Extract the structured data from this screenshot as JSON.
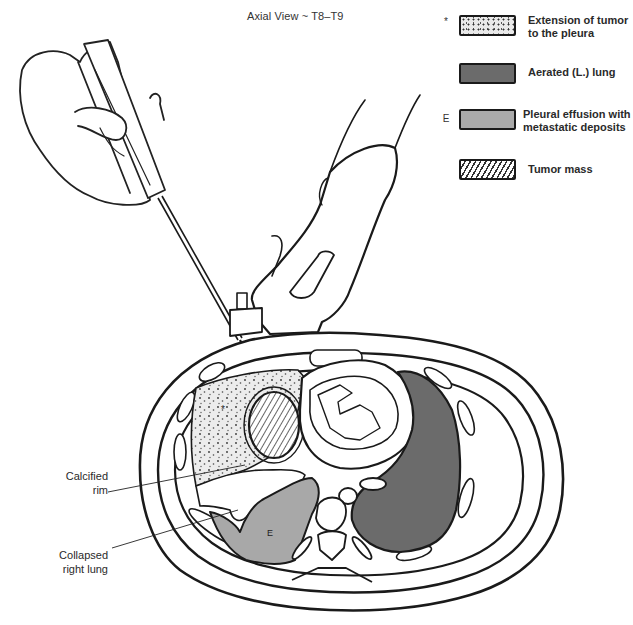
{
  "title": "Axial View ~ T8–T9",
  "legend": {
    "items": [
      {
        "marker": "*",
        "swatch": "dotted",
        "label": "Extension of tumor\nto the pleura"
      },
      {
        "marker": "",
        "swatch": "dark-gray",
        "label": "Aerated (L.) lung"
      },
      {
        "marker": "E",
        "swatch": "light-gray",
        "label": "Pleural effusion with\nmetastatic deposits"
      },
      {
        "marker": "",
        "swatch": "hatched",
        "label": "Tumor mass"
      }
    ]
  },
  "callouts": [
    {
      "label": "Calcified\nrim"
    },
    {
      "label": "Collapsed\nright lung"
    }
  ],
  "in_figure_labels": {
    "effusion_marker": "E",
    "pleura_marker": "*"
  },
  "colors": {
    "line": "#1a1a1a",
    "aerated_lung": "#6b6b6b",
    "effusion": "#a8a8a8",
    "dotted_bg": "#ececec"
  }
}
